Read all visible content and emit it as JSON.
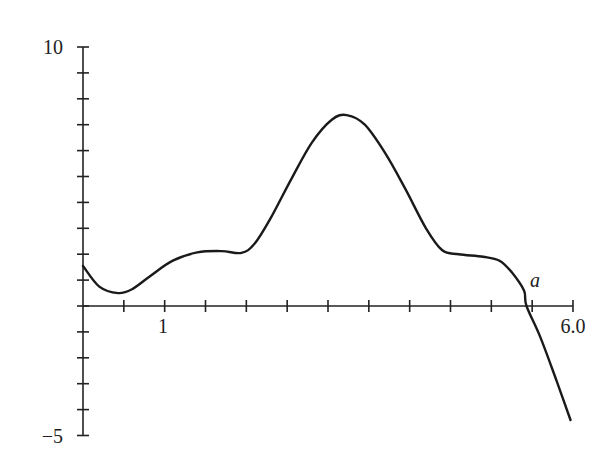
{
  "chart_data": {
    "type": "line",
    "title": "",
    "xlabel": "",
    "ylabel": "",
    "xlim": [
      0,
      6.0
    ],
    "ylim": [
      -5,
      10
    ],
    "grid": false,
    "legend": null,
    "x_ticks": [
      0,
      0.5,
      1,
      1.5,
      2,
      2.5,
      3,
      3.5,
      4,
      4.5,
      5,
      5.5,
      6.0
    ],
    "x_tick_labels": [
      {
        "value": 1,
        "label": "1"
      },
      {
        "value": 6.0,
        "label": "6.0"
      }
    ],
    "y_ticks": [
      -5,
      -4,
      -3,
      -2,
      -1,
      0,
      1,
      2,
      3,
      4,
      5,
      6,
      7,
      8,
      9,
      10
    ],
    "y_tick_labels": [
      {
        "value": 10,
        "label": "10"
      },
      {
        "value": -5,
        "label": "−5"
      }
    ],
    "annotations": [
      {
        "text": "a",
        "x": 5.6,
        "y": 0.55,
        "note": "x-intercept of the curve"
      }
    ],
    "series": [
      {
        "name": "f(x)",
        "color": "#1a1a1a",
        "x": [
          0,
          0.2,
          0.43,
          0.6,
          0.82,
          1.1,
          1.4,
          1.7,
          1.94,
          2.1,
          2.3,
          2.55,
          2.8,
          3.05,
          3.23,
          3.45,
          3.7,
          3.95,
          4.2,
          4.4,
          4.6,
          4.9,
          5.1,
          5.25,
          5.4,
          5.43,
          5.6,
          5.8,
          5.97
        ],
        "y": [
          1.55,
          0.75,
          0.5,
          0.65,
          1.15,
          1.75,
          2.07,
          2.12,
          2.05,
          2.4,
          3.4,
          4.9,
          6.3,
          7.2,
          7.37,
          7.0,
          5.9,
          4.5,
          3.0,
          2.15,
          2.0,
          1.9,
          1.75,
          1.3,
          0.6,
          0.0,
          -1.2,
          -2.9,
          -4.4
        ]
      }
    ]
  },
  "labels": {
    "y_max": "10",
    "y_min": "−5",
    "x_one": "1",
    "x_max": "6.0",
    "point_a": "a"
  }
}
